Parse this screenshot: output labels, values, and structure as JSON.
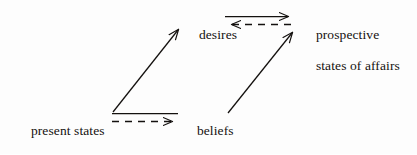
{
  "figure": {
    "type": "diagram",
    "kind": "commutative-square",
    "background_color": "#fdfdfd",
    "ink_color": "#14110f"
  },
  "nodes": [
    {
      "id": "present-states-of-affairs",
      "name": "node-present-states-of-affairs",
      "line1": "present states",
      "line2": "of affairs",
      "text": "present states of affairs",
      "position": "bottom-left"
    },
    {
      "id": "beliefs",
      "name": "node-beliefs",
      "line1": "beliefs",
      "line2": "",
      "text": "beliefs",
      "position": "bottom-center"
    },
    {
      "id": "desires",
      "name": "node-desires",
      "line1": "desires",
      "line2": "",
      "text": "desires",
      "position": "top-center"
    },
    {
      "id": "prospective-states-of-affairs",
      "name": "node-prospective-states-of-affairs",
      "line1": "prospective",
      "line2": "states of affairs",
      "text": "prospective states of affairs",
      "position": "top-right"
    }
  ],
  "edges": [
    {
      "id": "present-to-beliefs-solid",
      "name": "edge-present-to-beliefs-solid",
      "from": "present-states-of-affairs",
      "to": "beliefs",
      "style": "solid",
      "arrowhead": "end",
      "direction": "right",
      "label": ""
    },
    {
      "id": "present-to-beliefs-dashed",
      "name": "edge-present-to-beliefs-dashed",
      "from": "present-states-of-affairs",
      "to": "beliefs",
      "style": "dashed",
      "arrowhead": "end",
      "direction": "right",
      "label": ""
    },
    {
      "id": "desires-to-prospective-solid",
      "name": "edge-desires-to-prospective-solid",
      "from": "desires",
      "to": "prospective-states-of-affairs",
      "style": "solid",
      "arrowhead": "end",
      "direction": "right",
      "label": ""
    },
    {
      "id": "prospective-to-desires-dashed",
      "name": "edge-prospective-to-desires-dashed",
      "from": "prospective-states-of-affairs",
      "to": "desires",
      "style": "dashed",
      "arrowhead": "end",
      "direction": "left",
      "label": ""
    },
    {
      "id": "present-to-desires-diagonal",
      "name": "edge-present-to-desires-diagonal",
      "from": "present-states-of-affairs",
      "to": "desires",
      "style": "solid",
      "arrowhead": "end",
      "direction": "up-right",
      "label": ""
    },
    {
      "id": "beliefs-to-prospective-diagonal",
      "name": "edge-beliefs-to-prospective-diagonal",
      "from": "beliefs",
      "to": "prospective-states-of-affairs",
      "style": "solid",
      "arrowhead": "end",
      "direction": "up-right",
      "label": ""
    }
  ]
}
